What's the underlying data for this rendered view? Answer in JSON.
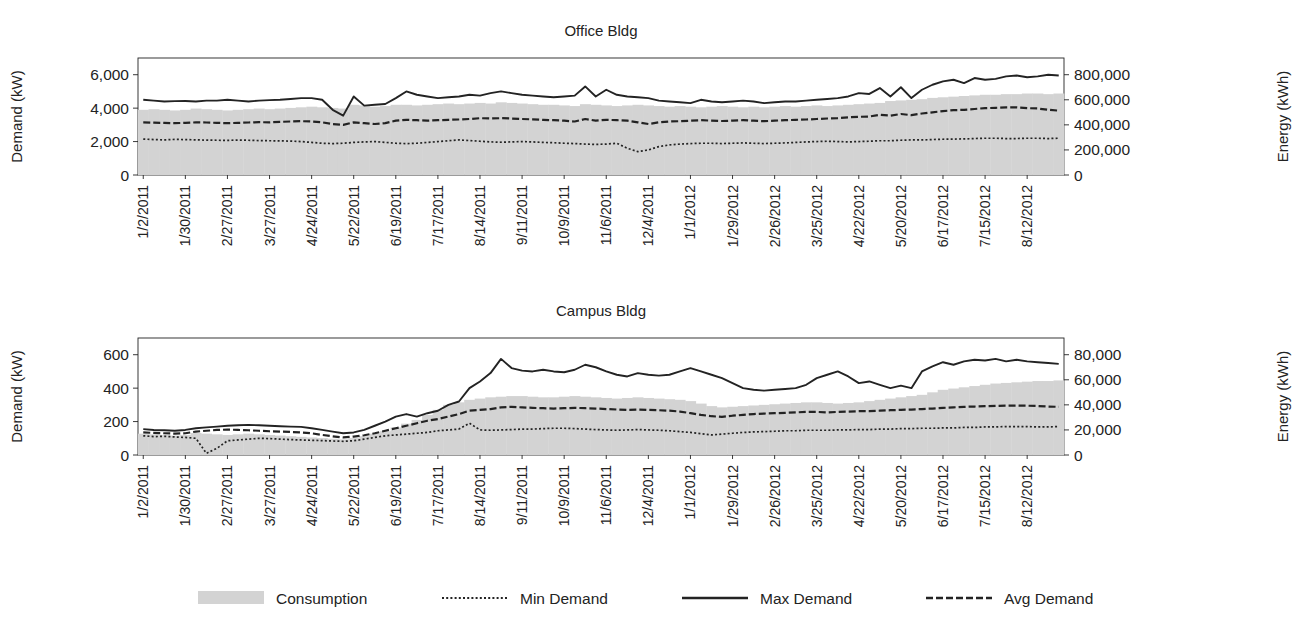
{
  "figure": {
    "background": "#ffffff",
    "ink": "#232323",
    "bar_color": "#d3d3d3",
    "bar_edge": "#c2c2c2"
  },
  "legend": {
    "position": "bottom-center",
    "items": [
      {
        "label": "Consumption",
        "marker": "filled-area-swatch",
        "style": "area",
        "color": "#d3d3d3"
      },
      {
        "label": "Min Demand",
        "marker": "dotted-line-swatch",
        "style": "dotted",
        "color": "#232323"
      },
      {
        "label": "Max Demand",
        "marker": "solid-line-swatch",
        "style": "solid",
        "color": "#232323"
      },
      {
        "label": "Avg Demand",
        "marker": "dashed-line-swatch",
        "style": "dashed",
        "color": "#232323"
      }
    ]
  },
  "chart_data": [
    {
      "id": "office",
      "type": "line",
      "title": "Office Bldg",
      "xlabel": "",
      "ylabel": "Demand (kW)",
      "y2label": "Energy (kWh)",
      "ylim": [
        0,
        7000
      ],
      "yticks": [
        0,
        2000,
        4000,
        6000
      ],
      "ytick_labels": [
        "0",
        "2,000",
        "4,000",
        "6,000"
      ],
      "y2lim": [
        0,
        933333
      ],
      "y2ticks": [
        0,
        200000,
        400000,
        600000,
        800000
      ],
      "y2tick_labels": [
        "0",
        "200,000",
        "400,000",
        "600,000",
        "800,000"
      ],
      "grid": false,
      "xtick_labels": [
        "1/2/2011",
        "1/30/2011",
        "2/27/2011",
        "3/27/2011",
        "4/24/2011",
        "5/22/2011",
        "6/19/2011",
        "7/17/2011",
        "8/14/2011",
        "9/11/2011",
        "10/9/2011",
        "11/6/2011",
        "12/4/2011",
        "1/1/2012",
        "1/29/2012",
        "2/26/2012",
        "3/25/2012",
        "4/22/2012",
        "5/20/2012",
        "6/17/2012",
        "7/15/2012",
        "8/12/2012"
      ],
      "xtick_interval": 4,
      "n_points": 88,
      "series": [
        {
          "name": "Consumption",
          "axis": "right",
          "style": "area",
          "units": "kWh",
          "values": [
            520000,
            525000,
            520000,
            515000,
            520000,
            530000,
            525000,
            520000,
            515000,
            520000,
            525000,
            530000,
            525000,
            530000,
            535000,
            540000,
            545000,
            540000,
            535000,
            530000,
            560000,
            555000,
            545000,
            550000,
            560000,
            560000,
            555000,
            560000,
            565000,
            570000,
            565000,
            570000,
            575000,
            570000,
            580000,
            575000,
            570000,
            565000,
            560000,
            560000,
            555000,
            550000,
            565000,
            560000,
            555000,
            550000,
            555000,
            560000,
            555000,
            550000,
            545000,
            550000,
            545000,
            540000,
            545000,
            550000,
            545000,
            540000,
            545000,
            540000,
            545000,
            550000,
            545000,
            550000,
            555000,
            550000,
            555000,
            560000,
            565000,
            570000,
            575000,
            590000,
            595000,
            600000,
            605000,
            615000,
            620000,
            625000,
            630000,
            635000,
            640000,
            640000,
            645000,
            645000,
            650000,
            650000,
            645000,
            650000
          ]
        },
        {
          "name": "Min Demand",
          "axis": "left",
          "style": "dotted",
          "units": "kW",
          "values": [
            2150,
            2120,
            2100,
            2130,
            2120,
            2100,
            2090,
            2080,
            2070,
            2090,
            2080,
            2060,
            2050,
            2040,
            2030,
            2000,
            1950,
            1900,
            1880,
            1900,
            1950,
            1980,
            2000,
            1950,
            1900,
            1880,
            1900,
            1950,
            2000,
            2050,
            2100,
            2060,
            2020,
            1980,
            1960,
            1980,
            2000,
            1980,
            1950,
            1930,
            1900,
            1880,
            1850,
            1830,
            1850,
            1900,
            1600,
            1400,
            1500,
            1700,
            1800,
            1850,
            1880,
            1900,
            1900,
            1880,
            1900,
            1920,
            1900,
            1880,
            1900,
            1920,
            1950,
            1980,
            2000,
            2020,
            2000,
            1980,
            2000,
            2020,
            2050,
            2050,
            2080,
            2100,
            2100,
            2120,
            2140,
            2150,
            2160,
            2180,
            2200,
            2200,
            2180,
            2180,
            2200,
            2200,
            2180,
            2200
          ]
        },
        {
          "name": "Max Demand",
          "axis": "left",
          "style": "solid",
          "units": "kW",
          "values": [
            4500,
            4450,
            4400,
            4420,
            4430,
            4400,
            4450,
            4450,
            4500,
            4450,
            4400,
            4450,
            4480,
            4500,
            4550,
            4600,
            4600,
            4500,
            3900,
            3550,
            4700,
            4150,
            4200,
            4250,
            4600,
            5000,
            4800,
            4700,
            4600,
            4650,
            4700,
            4800,
            4750,
            4900,
            5000,
            4900,
            4800,
            4750,
            4700,
            4650,
            4700,
            4750,
            5300,
            4700,
            5100,
            4800,
            4700,
            4650,
            4600,
            4450,
            4400,
            4350,
            4300,
            4500,
            4400,
            4350,
            4400,
            4450,
            4400,
            4300,
            4350,
            4400,
            4400,
            4450,
            4500,
            4550,
            4600,
            4700,
            4900,
            4850,
            5200,
            4700,
            5250,
            4600,
            5100,
            5400,
            5600,
            5700,
            5500,
            5800,
            5700,
            5750,
            5900,
            5950,
            5850,
            5900,
            6000,
            5950
          ]
        },
        {
          "name": "Avg Demand",
          "axis": "left",
          "style": "dashed",
          "units": "kW",
          "values": [
            3150,
            3130,
            3120,
            3100,
            3120,
            3150,
            3140,
            3120,
            3100,
            3120,
            3140,
            3160,
            3150,
            3180,
            3200,
            3220,
            3200,
            3150,
            3050,
            3000,
            3150,
            3100,
            3050,
            3100,
            3250,
            3300,
            3280,
            3250,
            3280,
            3300,
            3320,
            3350,
            3400,
            3380,
            3400,
            3380,
            3350,
            3330,
            3300,
            3280,
            3250,
            3200,
            3350,
            3250,
            3300,
            3280,
            3250,
            3150,
            3050,
            3150,
            3200,
            3220,
            3250,
            3280,
            3250,
            3230,
            3250,
            3280,
            3250,
            3220,
            3250,
            3280,
            3300,
            3320,
            3350,
            3380,
            3400,
            3450,
            3480,
            3500,
            3600,
            3550,
            3650,
            3580,
            3680,
            3750,
            3820,
            3880,
            3900,
            3950,
            4000,
            4020,
            4050,
            4050,
            4000,
            3980,
            3900,
            3850
          ]
        }
      ]
    },
    {
      "id": "campus",
      "type": "line",
      "title": "Campus Bldg",
      "xlabel": "",
      "ylabel": "Demand (kW)",
      "y2label": "Energy (kWh)",
      "ylim": [
        0,
        700
      ],
      "yticks": [
        0,
        200,
        400,
        600
      ],
      "ytick_labels": [
        "0",
        "200",
        "400",
        "600"
      ],
      "y2lim": [
        0,
        93333
      ],
      "y2ticks": [
        0,
        20000,
        40000,
        60000,
        80000
      ],
      "y2tick_labels": [
        "0",
        "20,000",
        "40,000",
        "60,000",
        "80,000"
      ],
      "grid": false,
      "xtick_labels": [
        "1/2/2011",
        "1/30/2011",
        "2/27/2011",
        "3/27/2011",
        "4/24/2011",
        "5/22/2011",
        "6/19/2011",
        "7/17/2011",
        "8/14/2011",
        "9/11/2011",
        "10/9/2011",
        "11/6/2011",
        "12/4/2011",
        "1/1/2012",
        "1/29/2012",
        "2/26/2012",
        "3/25/2012",
        "4/22/2012",
        "5/20/2012",
        "6/17/2012",
        "7/15/2012",
        "8/12/2012"
      ],
      "xtick_interval": 4,
      "n_points": 88,
      "series": [
        {
          "name": "Consumption",
          "axis": "right",
          "style": "area",
          "units": "kWh",
          "values": [
            17000,
            16500,
            16000,
            15500,
            16000,
            17500,
            17000,
            16500,
            16000,
            16500,
            17000,
            16500,
            16000,
            15500,
            15000,
            14500,
            14000,
            13500,
            13000,
            12500,
            13500,
            15000,
            17000,
            19000,
            22000,
            25000,
            28000,
            32000,
            36000,
            40000,
            42000,
            44000,
            45000,
            46000,
            46500,
            47000,
            47000,
            46500,
            46000,
            46000,
            46500,
            47000,
            46500,
            46000,
            45500,
            45000,
            45500,
            46000,
            45500,
            45000,
            44500,
            44000,
            43000,
            41000,
            39000,
            38000,
            38500,
            39000,
            39500,
            40000,
            40500,
            41000,
            41500,
            42000,
            42000,
            41500,
            41000,
            41500,
            42000,
            43000,
            44000,
            45000,
            46000,
            47000,
            48000,
            50000,
            52000,
            53000,
            54000,
            55000,
            56000,
            57000,
            57500,
            58000,
            58500,
            59000,
            59000,
            59500
          ]
        },
        {
          "name": "Min Demand",
          "axis": "left",
          "style": "dotted",
          "units": "kW",
          "values": [
            115,
            110,
            112,
            108,
            105,
            100,
            10,
            40,
            85,
            90,
            95,
            100,
            98,
            95,
            92,
            90,
            88,
            86,
            84,
            82,
            85,
            95,
            105,
            115,
            120,
            125,
            130,
            135,
            145,
            150,
            155,
            190,
            150,
            148,
            150,
            152,
            155,
            155,
            158,
            160,
            160,
            158,
            155,
            152,
            150,
            148,
            150,
            152,
            150,
            148,
            145,
            140,
            135,
            128,
            120,
            125,
            130,
            135,
            138,
            140,
            142,
            145,
            145,
            148,
            148,
            148,
            150,
            150,
            152,
            152,
            155,
            155,
            158,
            158,
            160,
            160,
            162,
            162,
            165,
            165,
            168,
            168,
            170,
            170,
            170,
            168,
            168,
            170
          ]
        },
        {
          "name": "Max Demand",
          "axis": "left",
          "style": "solid",
          "units": "kW",
          "values": [
            155,
            150,
            148,
            145,
            150,
            160,
            165,
            170,
            175,
            178,
            180,
            178,
            175,
            172,
            170,
            168,
            160,
            150,
            140,
            130,
            135,
            150,
            175,
            200,
            230,
            245,
            230,
            250,
            265,
            300,
            320,
            400,
            440,
            490,
            575,
            520,
            505,
            500,
            510,
            500,
            495,
            510,
            540,
            525,
            500,
            480,
            470,
            490,
            480,
            475,
            480,
            500,
            520,
            500,
            480,
            460,
            430,
            400,
            390,
            385,
            390,
            395,
            400,
            420,
            460,
            480,
            500,
            470,
            430,
            440,
            420,
            400,
            415,
            400,
            500,
            530,
            555,
            540,
            560,
            570,
            565,
            575,
            560,
            570,
            560,
            555,
            550,
            545
          ]
        },
        {
          "name": "Avg Demand",
          "axis": "left",
          "style": "dashed",
          "units": "kW",
          "values": [
            135,
            132,
            130,
            128,
            130,
            140,
            145,
            150,
            152,
            150,
            148,
            145,
            142,
            140,
            138,
            135,
            130,
            120,
            112,
            105,
            110,
            118,
            130,
            145,
            160,
            175,
            190,
            205,
            215,
            230,
            245,
            265,
            270,
            275,
            285,
            288,
            285,
            282,
            280,
            278,
            280,
            282,
            280,
            278,
            275,
            272,
            270,
            272,
            270,
            268,
            265,
            260,
            250,
            240,
            232,
            228,
            235,
            240,
            245,
            248,
            250,
            252,
            255,
            258,
            258,
            255,
            258,
            260,
            262,
            262,
            265,
            268,
            270,
            272,
            275,
            278,
            282,
            285,
            288,
            290,
            292,
            294,
            295,
            296,
            295,
            293,
            290,
            288
          ]
        }
      ]
    }
  ]
}
